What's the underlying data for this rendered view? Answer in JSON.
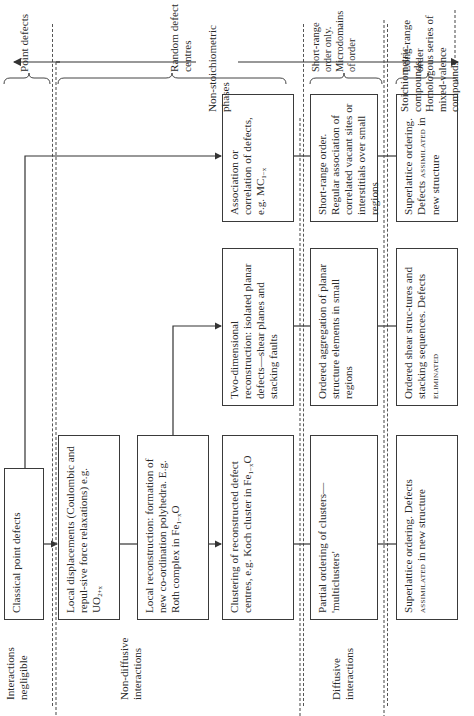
{
  "rows": {
    "interactions_negligible": "Interactions negligible",
    "non_diffusive": "Non-diffusive interactions",
    "diffusive": "Diffusive interactions"
  },
  "boxes": {
    "classical": "Classical point defects",
    "local_displacements_text": "Local displacements (Coulombic and repul-sive force relaxations) e.g. UO",
    "local_displacements_sub": "2+x",
    "local_reconstruction_text": "Local reconstruction: formation of new co-ordination polyhedra. E.g. Roth complex in Fe",
    "local_reconstruction_sub": "1−x",
    "local_reconstruction_tail": "O",
    "clustering_text": "Clustering of reconstructed defect centres, e.g. Koch cluster in Fe",
    "clustering_sub": "1−x",
    "clustering_tail": "O",
    "two_dim": "Two-dimensional reconstruction: isolated planar defects—shear planes and stacking faults",
    "association_text": "Association or correlation of defects, e.g. MC",
    "association_sub": "1−x",
    "partial_ordering": "Partial ordering of clusters— 'multiclusters'",
    "ordered_aggregation": "Ordered aggregation of planar structure elements in small regions",
    "short_range_box": "Short-range order. Regular association of correlated vacant sites or interstitials over small regions",
    "superlattice1_text": "Superlattice ordering. Defects",
    "superlattice1_sc": "assimilated",
    "superlattice1_tail": "in new structure",
    "ordered_shear_text": "Ordered shear struc-tures and stacking sequences. Defects",
    "ordered_shear_sc": "eliminated",
    "superlattice2_text": "Superlattice ordering. Defects",
    "superlattice2_sc": "assimilated",
    "superlattice2_tail": "in new structure"
  },
  "right_labels": {
    "point_defects": "Point defects",
    "random_defect_centres": "Random defect centres",
    "non_stoichiometric": "Non-stoichiometric phases",
    "short_range_only": "Short-range order only. Microdomains of order",
    "long_range": "Long-range order",
    "stoichiometric": "Stoichiometric compounds. Homologous series of mixed-valence compounds"
  }
}
